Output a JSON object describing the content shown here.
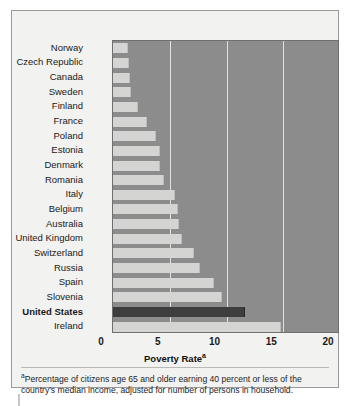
{
  "chart_data": {
    "type": "bar",
    "orientation": "horizontal",
    "title": "",
    "xlabel": "Poverty Rate",
    "xlabel_superscript": "a",
    "ylabel": "",
    "xlim": [
      0,
      20
    ],
    "xticks": [
      0,
      5,
      10,
      15,
      20
    ],
    "xtick_labels": [
      "0",
      "5",
      "10",
      "15",
      "20"
    ],
    "grid": true,
    "grid_axis": "x",
    "legend": "none",
    "highlight_category": "United States",
    "categories": [
      "Norway",
      "Czech Republic",
      "Canada",
      "Sweden",
      "Finland",
      "France",
      "Poland",
      "Estonia",
      "Denmark",
      "Romania",
      "Italy",
      "Belgium",
      "Australia",
      "United Kingdom",
      "Switzerland",
      "Russia",
      "Spain",
      "Slovenia",
      "United States",
      "Ireland"
    ],
    "values": [
      1.3,
      1.4,
      1.5,
      1.6,
      2.2,
      3.0,
      3.8,
      4.1,
      4.1,
      4.5,
      5.5,
      5.7,
      5.8,
      6.1,
      7.1,
      7.7,
      8.9,
      9.6,
      11.6,
      14.8
    ],
    "series": [
      {
        "name": "Poverty Rate",
        "values": [
          1.3,
          1.4,
          1.5,
          1.6,
          2.2,
          3.0,
          3.8,
          4.1,
          4.1,
          4.5,
          5.5,
          5.7,
          5.8,
          6.1,
          7.1,
          7.7,
          8.9,
          9.6,
          11.6,
          14.8
        ]
      }
    ],
    "colors": {
      "bar": "#d4d4d2",
      "bar_highlight": "#3d3d3d",
      "plot_background": "#8c8c8c",
      "gridline": "#e8e8e6",
      "figure_background": "#f2f2f0",
      "text": "#1a1a1a"
    },
    "footnote_marker": "a",
    "footnote": "Percentage of citizens age 65 and older earning 40 percent or less of the country's median income, adjusted for number of persons in household."
  }
}
